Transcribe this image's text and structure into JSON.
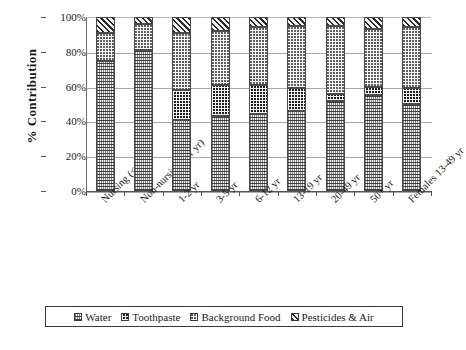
{
  "chart_data": {
    "type": "bar",
    "subtype": "stacked-percent",
    "title": "",
    "xlabel": "",
    "ylabel": "% Contribution",
    "ylim": [
      0,
      100
    ],
    "ytick_labels": [
      "100%",
      "80%",
      "60%",
      "40%",
      "20%",
      "0%"
    ],
    "ytick_values": [
      100,
      80,
      60,
      40,
      20,
      0
    ],
    "grid": true,
    "legend_position": "bottom",
    "categories": [
      "Nursing (<1 yr)",
      "Non-nursing (<1 yr)",
      "1-2 yr",
      "3-5 yr",
      "6-12 yr",
      "13-19 yr",
      "20-49 yr",
      "50+ yr",
      "Females 13-49 yr"
    ],
    "series": [
      {
        "name": "Water",
        "pattern": "water-wave",
        "values": [
          75,
          81,
          41,
          43,
          44,
          46,
          52,
          55,
          50
        ]
      },
      {
        "name": "Toothpaste",
        "pattern": "toothpaste-dark-check",
        "values": [
          0,
          0,
          17,
          18,
          17,
          13,
          4,
          5,
          9
        ]
      },
      {
        "name": "Background Food",
        "pattern": "background-food-dots",
        "values": [
          16,
          15,
          33,
          31,
          33,
          36,
          39,
          33,
          35
        ]
      },
      {
        "name": "Pesticides & Air",
        "pattern": "pesticides-diagonal-hatch",
        "values": [
          9,
          4,
          9,
          8,
          6,
          5,
          5,
          7,
          6
        ]
      }
    ]
  },
  "legend": {
    "items": [
      {
        "label": "Water"
      },
      {
        "label": "Toothpaste"
      },
      {
        "label": "Background Food"
      },
      {
        "label": "Pesticides & Air"
      }
    ]
  },
  "colors": {
    "axis": "#555555",
    "gridline": "#a9a9a9",
    "outline": "#4a4a4a",
    "text": "#1a1a1a"
  }
}
